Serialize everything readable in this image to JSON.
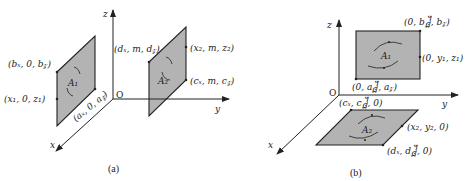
{
  "figure": {
    "panels": [
      {
        "id": "a",
        "caption": "(a)",
        "axes": {
          "x": "x",
          "y": "y",
          "z": "z",
          "origin": "O"
        },
        "planes": [
          {
            "name": "A1",
            "label": "A₁",
            "points": [
              {
                "text": "(bₓ, 0, b_z)",
                "display": "(bₓ, 0, b𝓏)"
              },
              {
                "text": "(x₁, 0, z₁)"
              },
              {
                "text": "(aₓ, 0, a_z)",
                "display": "(aₓ, 0, a𝓏)"
              }
            ]
          },
          {
            "name": "A2",
            "label": "A₂",
            "points": [
              {
                "text": "(dₓ, m, d_z)",
                "display": "(dₓ, m, d𝓏)"
              },
              {
                "text": "(x₂, m, z₂)"
              },
              {
                "text": "(cₓ, m, c_z)",
                "display": "(cₓ, m, c𝓏)"
              }
            ]
          }
        ]
      },
      {
        "id": "b",
        "caption": "(b)",
        "axes": {
          "x": "x",
          "y": "y",
          "z": "z",
          "origin": "O"
        },
        "planes": [
          {
            "name": "A1",
            "label": "A₁",
            "points": [
              {
                "text": "(0, b_y, b_z)",
                "display": "(0, b᧸, b𝓏)"
              },
              {
                "text": "(0, y₁, z₁)"
              },
              {
                "text": "(0, a_y, a_z)",
                "display": "(0, a᧸, a𝓏)"
              }
            ]
          },
          {
            "name": "A2",
            "label": "A₂",
            "points": [
              {
                "text": "(cₓ, c_y, 0)",
                "display": "(cₓ, c᧸, 0)"
              },
              {
                "text": "(x₂, y₂, 0)"
              },
              {
                "text": "(dₓ, d_y, 0)",
                "display": "(dₓ, d᧸, 0)"
              }
            ]
          }
        ]
      }
    ]
  }
}
